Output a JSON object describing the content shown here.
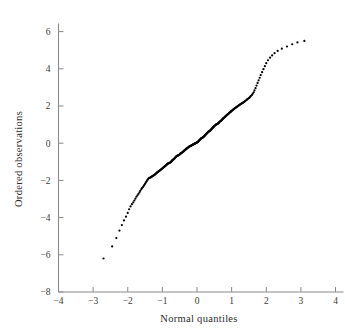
{
  "chart_data": {
    "type": "scatter",
    "title": "",
    "subtitle": "",
    "xlabel": "Normal quantiles",
    "ylabel": "Ordered observations",
    "xlim": [
      -4,
      4
    ],
    "ylim": [
      -8,
      7
    ],
    "grid": false,
    "legend": null,
    "annotations": [],
    "x_ticks": [
      -4,
      -3,
      -2,
      -1,
      0,
      1,
      2,
      3,
      4
    ],
    "x_tick_labels": [
      "−4",
      "−3",
      "−2",
      "−1",
      "0",
      "1",
      "2",
      "3",
      "4"
    ],
    "y_ticks": [
      -8,
      -6,
      -4,
      -2,
      0,
      2,
      4,
      6
    ],
    "y_tick_labels": [
      "−8",
      "−6",
      "−4",
      "−2",
      "0",
      "2",
      "4",
      "6"
    ],
    "marker": "dot",
    "marker_color": "#000000",
    "marker_size": 1.1,
    "axis_color": "#8a8a8a",
    "background_color": "#ffffff",
    "x": [
      -2.7,
      -2.45,
      -2.33,
      -2.24,
      -2.17,
      -2.11,
      -2.05,
      -2.0,
      -1.96,
      -1.92,
      -1.88,
      -1.84,
      -1.81,
      -1.78,
      -1.75,
      -1.72,
      -1.69,
      -1.66,
      -1.64,
      -1.61,
      -1.59,
      -1.56,
      -1.54,
      -1.52,
      -1.5,
      -1.48,
      -1.46,
      -1.44,
      -1.42,
      -1.4,
      -1.38,
      -1.36,
      -1.34,
      -1.33,
      -1.31,
      -1.29,
      -1.28,
      -1.26,
      -1.24,
      -1.23,
      -1.21,
      -1.2,
      -1.18,
      -1.17,
      -1.15,
      -1.14,
      -1.13,
      -1.11,
      -1.1,
      -1.08,
      -1.07,
      -1.06,
      -1.04,
      -1.03,
      -1.02,
      -1.0,
      -0.99,
      -0.98,
      -0.97,
      -0.95,
      -0.94,
      -0.93,
      -0.92,
      -0.9,
      -0.89,
      -0.88,
      -0.87,
      -0.86,
      -0.84,
      -0.83,
      -0.82,
      -0.81,
      -0.8,
      -0.79,
      -0.77,
      -0.76,
      -0.75,
      -0.74,
      -0.73,
      -0.72,
      -0.71,
      -0.7,
      -0.69,
      -0.67,
      -0.66,
      -0.65,
      -0.64,
      -0.63,
      -0.62,
      -0.61,
      -0.6,
      -0.59,
      -0.58,
      -0.57,
      -0.56,
      -0.55,
      -0.54,
      -0.53,
      -0.51,
      -0.5,
      -0.49,
      -0.48,
      -0.47,
      -0.46,
      -0.45,
      -0.44,
      -0.43,
      -0.42,
      -0.41,
      -0.4,
      -0.39,
      -0.38,
      -0.37,
      -0.36,
      -0.35,
      -0.34,
      -0.33,
      -0.32,
      -0.31,
      -0.3,
      -0.29,
      -0.28,
      -0.27,
      -0.26,
      -0.25,
      -0.24,
      -0.23,
      -0.22,
      -0.21,
      -0.2,
      -0.19,
      -0.18,
      -0.17,
      -0.16,
      -0.15,
      -0.14,
      -0.13,
      -0.12,
      -0.11,
      -0.1,
      -0.09,
      -0.08,
      -0.07,
      -0.06,
      -0.05,
      -0.04,
      -0.03,
      -0.02,
      -0.01,
      0.0,
      0.01,
      0.02,
      0.03,
      0.04,
      0.05,
      0.06,
      0.07,
      0.08,
      0.09,
      0.1,
      0.11,
      0.12,
      0.13,
      0.14,
      0.15,
      0.16,
      0.17,
      0.18,
      0.19,
      0.2,
      0.21,
      0.22,
      0.23,
      0.24,
      0.25,
      0.26,
      0.27,
      0.28,
      0.29,
      0.3,
      0.31,
      0.32,
      0.33,
      0.34,
      0.35,
      0.36,
      0.37,
      0.38,
      0.39,
      0.4,
      0.41,
      0.42,
      0.43,
      0.44,
      0.45,
      0.46,
      0.47,
      0.48,
      0.49,
      0.5,
      0.51,
      0.53,
      0.54,
      0.55,
      0.56,
      0.57,
      0.58,
      0.59,
      0.6,
      0.61,
      0.62,
      0.63,
      0.64,
      0.65,
      0.66,
      0.67,
      0.69,
      0.7,
      0.71,
      0.72,
      0.73,
      0.74,
      0.75,
      0.76,
      0.77,
      0.79,
      0.8,
      0.81,
      0.82,
      0.83,
      0.84,
      0.86,
      0.87,
      0.88,
      0.89,
      0.9,
      0.92,
      0.93,
      0.94,
      0.95,
      0.97,
      0.98,
      0.99,
      1.0,
      1.02,
      1.03,
      1.04,
      1.06,
      1.07,
      1.08,
      1.1,
      1.11,
      1.13,
      1.14,
      1.15,
      1.17,
      1.18,
      1.2,
      1.21,
      1.23,
      1.24,
      1.26,
      1.28,
      1.29,
      1.31,
      1.33,
      1.34,
      1.36,
      1.38,
      1.4,
      1.42,
      1.44,
      1.46,
      1.48,
      1.5,
      1.52,
      1.54,
      1.56,
      1.59,
      1.61,
      1.64,
      1.66,
      1.69,
      1.72,
      1.75,
      1.78,
      1.81,
      1.84,
      1.88,
      1.92,
      1.96,
      2.0,
      2.05,
      2.11,
      2.17,
      2.24,
      2.33,
      2.45,
      2.6,
      2.75,
      2.9,
      3.1
    ],
    "y": [
      -6.2,
      -5.55,
      -5.1,
      -4.7,
      -4.4,
      -4.15,
      -3.95,
      -3.75,
      -3.55,
      -3.4,
      -3.28,
      -3.18,
      -3.08,
      -2.98,
      -2.88,
      -2.8,
      -2.72,
      -2.64,
      -2.56,
      -2.48,
      -2.42,
      -2.36,
      -2.3,
      -2.24,
      -2.18,
      -2.12,
      -2.06,
      -2.0,
      -1.95,
      -1.9,
      -1.86,
      -1.86,
      -1.84,
      -1.82,
      -1.8,
      -1.78,
      -1.76,
      -1.74,
      -1.72,
      -1.7,
      -1.68,
      -1.66,
      -1.63,
      -1.6,
      -1.58,
      -1.56,
      -1.54,
      -1.52,
      -1.5,
      -1.48,
      -1.46,
      -1.44,
      -1.42,
      -1.4,
      -1.38,
      -1.36,
      -1.34,
      -1.32,
      -1.3,
      -1.28,
      -1.26,
      -1.24,
      -1.22,
      -1.2,
      -1.18,
      -1.16,
      -1.14,
      -1.12,
      -1.1,
      -1.09,
      -1.08,
      -1.07,
      -1.06,
      -1.05,
      -1.04,
      -1.02,
      -1.0,
      -0.98,
      -0.96,
      -0.94,
      -0.92,
      -0.9,
      -0.88,
      -0.86,
      -0.84,
      -0.82,
      -0.8,
      -0.78,
      -0.76,
      -0.74,
      -0.72,
      -0.7,
      -0.69,
      -0.68,
      -0.67,
      -0.66,
      -0.65,
      -0.64,
      -0.62,
      -0.6,
      -0.58,
      -0.56,
      -0.55,
      -0.54,
      -0.53,
      -0.52,
      -0.5,
      -0.48,
      -0.46,
      -0.45,
      -0.44,
      -0.42,
      -0.4,
      -0.38,
      -0.37,
      -0.36,
      -0.34,
      -0.32,
      -0.3,
      -0.29,
      -0.28,
      -0.26,
      -0.25,
      -0.24,
      -0.22,
      -0.2,
      -0.19,
      -0.18,
      -0.17,
      -0.16,
      -0.15,
      -0.14,
      -0.13,
      -0.12,
      -0.11,
      -0.1,
      -0.09,
      -0.08,
      -0.07,
      -0.06,
      -0.05,
      -0.04,
      -0.03,
      -0.02,
      -0.01,
      0.0,
      0.01,
      0.02,
      0.03,
      0.04,
      0.05,
      0.06,
      0.08,
      0.1,
      0.12,
      0.14,
      0.16,
      0.18,
      0.2,
      0.22,
      0.24,
      0.26,
      0.27,
      0.28,
      0.29,
      0.3,
      0.31,
      0.32,
      0.34,
      0.36,
      0.38,
      0.4,
      0.42,
      0.44,
      0.46,
      0.48,
      0.5,
      0.52,
      0.54,
      0.56,
      0.58,
      0.6,
      0.62,
      0.63,
      0.64,
      0.65,
      0.66,
      0.68,
      0.7,
      0.72,
      0.74,
      0.76,
      0.78,
      0.8,
      0.82,
      0.84,
      0.86,
      0.88,
      0.9,
      0.92,
      0.94,
      0.96,
      0.98,
      1.0,
      1.01,
      1.02,
      1.03,
      1.04,
      1.05,
      1.06,
      1.08,
      1.1,
      1.12,
      1.14,
      1.16,
      1.18,
      1.2,
      1.22,
      1.24,
      1.26,
      1.28,
      1.3,
      1.32,
      1.34,
      1.36,
      1.38,
      1.4,
      1.42,
      1.44,
      1.46,
      1.48,
      1.5,
      1.52,
      1.54,
      1.56,
      1.58,
      1.6,
      1.62,
      1.64,
      1.66,
      1.68,
      1.7,
      1.72,
      1.74,
      1.76,
      1.78,
      1.8,
      1.82,
      1.84,
      1.86,
      1.88,
      1.9,
      1.92,
      1.94,
      1.96,
      1.98,
      2.0,
      2.02,
      2.04,
      2.06,
      2.08,
      2.1,
      2.12,
      2.14,
      2.16,
      2.18,
      2.2,
      2.22,
      2.25,
      2.28,
      2.31,
      2.34,
      2.37,
      2.4,
      2.43,
      2.46,
      2.5,
      2.55,
      2.6,
      2.66,
      2.74,
      2.84,
      2.96,
      3.1,
      3.24,
      3.38,
      3.52,
      3.66,
      3.82,
      3.98,
      4.14,
      4.3,
      4.46,
      4.6,
      4.72,
      4.84,
      4.96,
      5.08,
      5.2,
      5.32,
      5.42,
      5.5
    ]
  },
  "figure": {
    "xlabel": "Normal quantiles",
    "ylabel": "Ordered observations"
  }
}
